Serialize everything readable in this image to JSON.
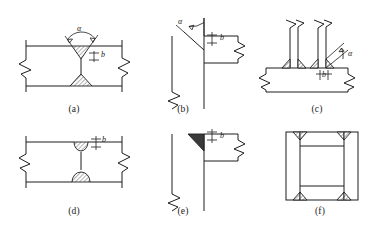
{
  "figure": {
    "type": "engineering-drawing",
    "background_color": "#ffffff",
    "line_color": "#1d1d1d",
    "hatch_fill_color": "#1d1d1d",
    "solid_fill_color": "#3a3a3a",
    "panel_count": 6
  },
  "symbols": {
    "angle": "α",
    "gap": "b"
  },
  "panels": [
    {
      "id": "a",
      "caption": "(a)",
      "description": "double-V groove butt weld between two plates",
      "annotations": [
        {
          "name": "groove-angle",
          "text": "α"
        },
        {
          "name": "root-gap",
          "text": "b"
        }
      ]
    },
    {
      "id": "b",
      "caption": "(b)",
      "description": "T-joint single bevel groove preparation",
      "annotations": [
        {
          "name": "groove-angle",
          "text": "α"
        },
        {
          "name": "root-gap",
          "text": "b"
        }
      ]
    },
    {
      "id": "c",
      "caption": "(c)",
      "description": "two vertical plates fillet welded to a horizontal plate",
      "annotations": [
        {
          "name": "groove-angle",
          "text": "α"
        },
        {
          "name": "root-gap",
          "text": "b"
        }
      ]
    },
    {
      "id": "d",
      "caption": "(d)",
      "description": "double-U groove butt weld between two plates",
      "annotations": [
        {
          "name": "root-gap",
          "text": "b"
        }
      ]
    },
    {
      "id": "e",
      "caption": "(e)",
      "description": "T-joint with completed bevel groove weld deposit",
      "annotations": [
        {
          "name": "root-gap",
          "text": "b"
        }
      ]
    },
    {
      "id": "f",
      "caption": "(f)",
      "description": "box section with fillet welds at four inner corners",
      "annotations": []
    }
  ]
}
